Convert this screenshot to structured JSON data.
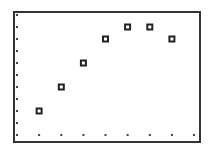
{
  "chart_data": {
    "type": "scatter",
    "title": "",
    "xlabel": "",
    "ylabel": "",
    "x": [
      1,
      2,
      3,
      4,
      5,
      6,
      7
    ],
    "y": [
      2,
      4,
      6,
      8,
      9,
      9,
      8
    ],
    "series": [
      {
        "name": "data",
        "marker": "hollow-square",
        "x": [
          1,
          2,
          3,
          4,
          5,
          6,
          7
        ],
        "values": [
          2,
          4,
          6,
          8,
          9,
          9,
          8
        ]
      }
    ],
    "xlim": [
      0,
      8
    ],
    "ylim": [
      0,
      10
    ],
    "x_ticks": [
      0,
      1,
      2,
      3,
      4,
      5,
      6,
      7,
      8
    ],
    "y_ticks": [
      0,
      1,
      2,
      3,
      4,
      5,
      6,
      7,
      8,
      9,
      10
    ],
    "tick_labels_shown": false,
    "grid": "tick-dots-on-left-and-bottom-edges",
    "legend": "none",
    "colors": {
      "frame": "#333333",
      "marker": "#222222",
      "tick_dot": "#444444",
      "background": "#ffffff"
    }
  }
}
